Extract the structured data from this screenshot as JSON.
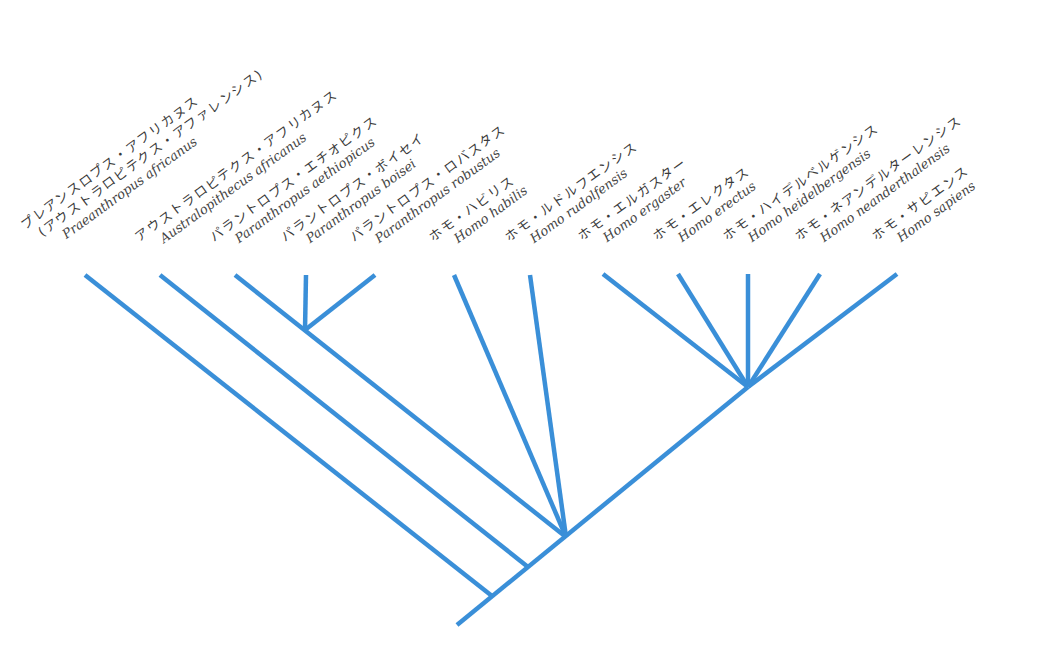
{
  "diagram": {
    "type": "cladogram",
    "line_color": "#3a8fd8",
    "text_color": "#3a3a3a",
    "root": [
      457,
      625
    ],
    "taxa": [
      {
        "id": "praeanthropus",
        "jp": "プレアンスロプス・アフリカヌス",
        "jp2": "(アウストラロピテクス・アファレンシス)",
        "latin": "Praeanthropus africanus",
        "tip": [
          85,
          275
        ]
      },
      {
        "id": "australopithecus",
        "jp": "アウストラロピテクス・アフリカヌス",
        "latin": "Australopithecus africanus",
        "tip": [
          160,
          275
        ]
      },
      {
        "id": "p-aethiopicus",
        "jp": "パラントロプス・エチオピクス",
        "latin": "Paranthropus aethiopicus",
        "tip": [
          235,
          275
        ]
      },
      {
        "id": "p-boisei",
        "jp": "パラントロプス・ボイセイ",
        "latin": "Paranthropus boisei",
        "tip": [
          306,
          275
        ]
      },
      {
        "id": "p-robustus",
        "jp": "パラントロプス・ロバスタス",
        "latin": "Paranthropus robustus",
        "tip": [
          375,
          275
        ]
      },
      {
        "id": "h-habilis",
        "jp": "ホモ・ハビリス",
        "latin": "Homo habilis",
        "tip": [
          454,
          275
        ]
      },
      {
        "id": "h-rudolfensis",
        "jp": "ホモ・ルドルフエンシス",
        "latin": "Homo rudolfensis",
        "tip": [
          530,
          275
        ]
      },
      {
        "id": "h-ergaster",
        "jp": "ホモ・エルガスター",
        "latin": "Homo ergaster",
        "tip": [
          603,
          274
        ]
      },
      {
        "id": "h-erectus",
        "jp": "ホモ・エレクタス",
        "latin": "Homo erectus",
        "tip": [
          678,
          274
        ]
      },
      {
        "id": "h-heidelbergensis",
        "jp": "ホモ・ハイデルベルゲンシス",
        "latin": "Homo heidelbergensis",
        "tip": [
          748,
          274
        ]
      },
      {
        "id": "h-neanderthalensis",
        "jp": "ホモ・ネアンデルターレンシス",
        "latin": "Homo neanderthalensis",
        "tip": [
          820,
          274
        ]
      },
      {
        "id": "h-sapiens",
        "jp": "ホモ・サピエンス",
        "latin": "Homo sapiens",
        "tip": [
          897,
          274
        ]
      }
    ],
    "nodes": {
      "n1": [
        492,
        596
      ],
      "n2": [
        528,
        567
      ],
      "n3": [
        566,
        537
      ],
      "paranthropus": [
        305,
        330
      ],
      "homo_late": [
        748,
        387
      ]
    }
  }
}
